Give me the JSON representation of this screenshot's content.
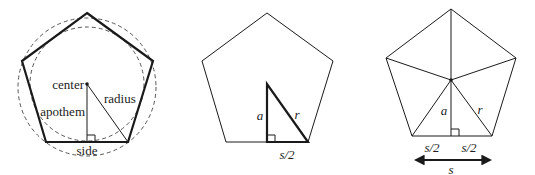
{
  "figure": {
    "panel1": {
      "labels": {
        "center": "center",
        "radius": "radius",
        "apothem": "apothem",
        "side": "side"
      }
    },
    "panel2": {
      "labels": {
        "a": "a",
        "r": "r",
        "half_side": "s/2"
      }
    },
    "panel3": {
      "labels": {
        "a": "a",
        "r": "r",
        "half_side_left": "s/2",
        "half_side_right": "s/2",
        "side": "s"
      }
    }
  },
  "colors": {
    "stroke": "#1a1a1a",
    "dashed": "#555555",
    "background": "#ffffff"
  }
}
